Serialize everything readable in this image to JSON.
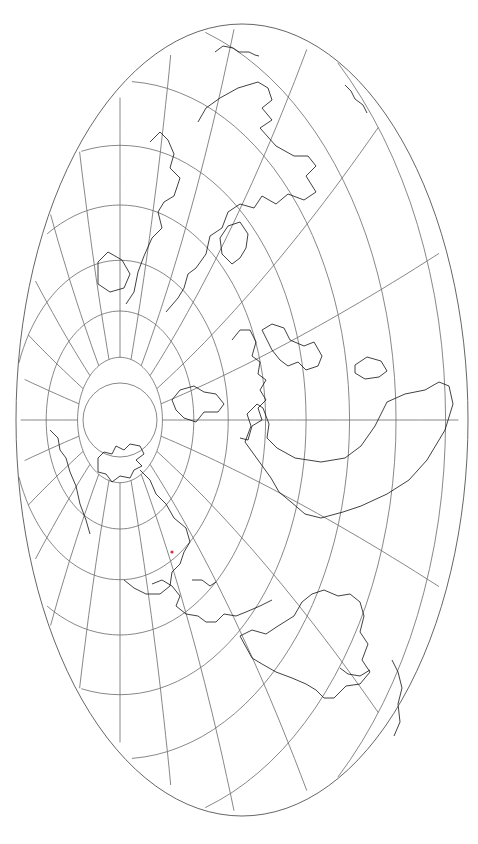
{
  "map": {
    "title": "",
    "projection": "oblique equal-area (Hammer-type), pole displaced left of center",
    "canvas": {
      "width": 478,
      "height": 844,
      "background": "#ffffff"
    },
    "outline": {
      "cx": 242,
      "cy": 420,
      "rx": 226,
      "ry": 396,
      "color": "#555555"
    },
    "pole": {
      "x": 120,
      "y": 420,
      "cap_radius": 37
    },
    "graticule": {
      "color": "#6a6a6a",
      "parallel_step_deg": 10,
      "meridian_step_deg": 15
    },
    "coastline_color": "#111111",
    "accent_marks": [
      {
        "x": 172,
        "y": 552,
        "color": "#cc3344"
      }
    ],
    "landmasses": [
      "Arctic islands (Canadian archipelago)",
      "Greenland",
      "North America",
      "Central America & Caribbean",
      "South America",
      "Europe",
      "Africa",
      "Asia",
      "Antarctic fragments (top)"
    ]
  }
}
